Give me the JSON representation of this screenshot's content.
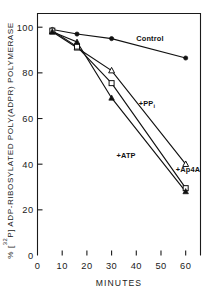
{
  "chart_data": {
    "type": "line",
    "title": "",
    "subtitle": "",
    "xlabel": "MINUTES",
    "ylabel_parts": {
      "prefix": "% [",
      "superscript": "32",
      "middle": "P] ADP-RIBOSYLATED POLY(ADPR) POLYMERASE"
    },
    "ylabel": "% [32P] ADP-RIBOSYLATED POLY(ADPR) POLYMERASE",
    "xlim": [
      0,
      66
    ],
    "ylim": [
      0,
      106
    ],
    "xticks": [
      0,
      10,
      20,
      30,
      40,
      50,
      60
    ],
    "xticklabels": [
      "0",
      "10",
      "20",
      "30",
      "40",
      "50",
      "60"
    ],
    "yticks": [
      0,
      20,
      40,
      60,
      80,
      100
    ],
    "yticklabels": [
      "0",
      "20",
      "40",
      "60",
      "80",
      "100"
    ],
    "grid": false,
    "legend": "inline-annotations",
    "x": [
      6,
      16,
      30,
      60
    ],
    "series": [
      {
        "name": "Control",
        "label": "Control",
        "marker": "filled-circle",
        "color": "#111111",
        "values": [
          99,
          97,
          95,
          86.5
        ],
        "label_x": 40,
        "label_y": 94
      },
      {
        "name": "+PPi",
        "label": "+PP",
        "label_sub": "i",
        "marker": "open-triangle",
        "color": "#111111",
        "values": [
          98,
          91,
          81,
          40
        ],
        "label_x": 41,
        "label_y": 65.5
      },
      {
        "name": "+Ap4A",
        "label": "+Ap4A",
        "marker": "open-square",
        "color": "#111111",
        "values": [
          98.5,
          91.5,
          75.5,
          29.5
        ],
        "label_x": 56,
        "label_y": 36.5
      },
      {
        "name": "+ATP",
        "label": "+ATP",
        "marker": "filled-triangle",
        "color": "#111111",
        "values": [
          98,
          93.5,
          69,
          28
        ],
        "label_x": 32,
        "label_y": 42.5
      }
    ]
  }
}
